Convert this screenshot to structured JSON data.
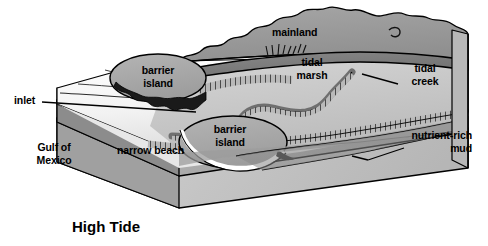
{
  "figure": {
    "caption": "High Tide",
    "type": "block-diagram"
  },
  "labels": {
    "inlet": "inlet",
    "gulf_line1": "Gulf of",
    "gulf_line2": "Mexico",
    "barrier_island_upper_line1": "barrier",
    "barrier_island_upper_line2": "island",
    "barrier_island_lower_line1": "barrier",
    "barrier_island_lower_line2": "island",
    "narrow_beach": "narrow beach",
    "mainland": "mainland",
    "tidal_marsh_line1": "tidal",
    "tidal_marsh_line2": "marsh",
    "tidal_creek_line1": "tidal",
    "tidal_creek_line2": "creek",
    "nutrient_mud_line1": "nutrient-rich",
    "nutrient_mud_line2": "mud"
  },
  "colors": {
    "ink": "#000000",
    "paper": "#ffffff",
    "water_light": "#efefef",
    "water_mid": "#d8d8d8",
    "block_side_dark": "#8e8e8e",
    "block_side_mid": "#b3b3b3",
    "block_side_light": "#cfcfcf",
    "marsh_light": "#c9c9c9",
    "marsh_mid": "#b0b0b0",
    "mainland_gray": "#9a9a9a",
    "channel_dark": "#7a7a7a",
    "island_gray": "#a8a8a8",
    "mud_gray": "#8a8a8a"
  }
}
